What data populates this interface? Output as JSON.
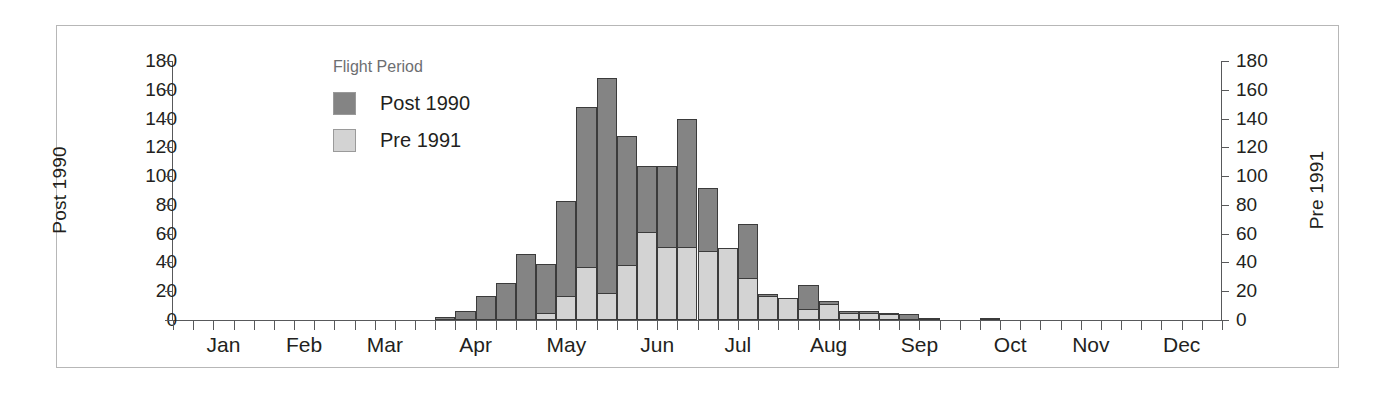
{
  "chart_data": {
    "type": "bar",
    "title": "",
    "subtitle": "",
    "xlabel": "",
    "ylabel": "Post 1990",
    "y2label": "Pre 1991",
    "ylim": [
      0,
      180
    ],
    "y2lim": [
      0,
      180
    ],
    "grid": false,
    "bar_mode": "overlay",
    "legend": {
      "position": "inside-top-left",
      "title": "Flight Period",
      "entries": [
        {
          "name": "Post 1990",
          "color": "#848484"
        },
        {
          "name": "Pre 1991",
          "color": "#d3d3d3"
        }
      ]
    },
    "x_axis": {
      "type": "week-of-year",
      "tick_count": 52,
      "month_labels": [
        "Jan",
        "Feb",
        "Mar",
        "Apr",
        "May",
        "Jun",
        "Jul",
        "Aug",
        "Sep",
        "Oct",
        "Nov",
        "Dec"
      ],
      "month_label_weeks": [
        2.5,
        6.5,
        10.5,
        15.0,
        19.5,
        24.0,
        28.0,
        32.5,
        37.0,
        41.5,
        45.5,
        50.0
      ]
    },
    "y_ticks": [
      0,
      20,
      40,
      60,
      80,
      100,
      120,
      140,
      160,
      180
    ],
    "y2_ticks": [
      0,
      20,
      40,
      60,
      80,
      100,
      120,
      140,
      160,
      180
    ],
    "series": [
      {
        "name": "Post 1990",
        "color": "#848484",
        "weeks": [
          14,
          15,
          16,
          17,
          18,
          19,
          20,
          21,
          22,
          23,
          24,
          25,
          26,
          27,
          28,
          29,
          30,
          31,
          32,
          33,
          34,
          35,
          36,
          37,
          38,
          41
        ],
        "values": [
          2,
          6,
          17,
          26,
          46,
          39,
          83,
          148,
          168,
          128,
          107,
          107,
          140,
          92,
          50,
          67,
          18,
          15,
          24,
          13,
          6,
          6,
          5,
          4,
          1,
          1
        ]
      },
      {
        "name": "Pre 1991",
        "color": "#d3d3d3",
        "weeks": [
          19,
          20,
          21,
          22,
          23,
          24,
          25,
          26,
          27,
          28,
          29,
          30,
          31,
          32,
          33,
          34,
          35,
          36
        ],
        "values": [
          5,
          17,
          37,
          19,
          38,
          61,
          51,
          51,
          48,
          50,
          29,
          17,
          15,
          8,
          11,
          5,
          5,
          4
        ]
      }
    ]
  },
  "axes": {
    "left_title": "Post 1990",
    "right_title": "Pre 1991",
    "tick_labels": [
      "180",
      "160",
      "140",
      "120",
      "100",
      "80",
      "60",
      "40",
      "20",
      "0"
    ]
  },
  "legend": {
    "title": "Flight Period",
    "items": [
      {
        "label": "Post 1990"
      },
      {
        "label": "Pre 1991"
      }
    ]
  },
  "months": [
    "Jan",
    "Feb",
    "Mar",
    "Apr",
    "May",
    "Jun",
    "Jul",
    "Aug",
    "Sep",
    "Oct",
    "Nov",
    "Dec"
  ]
}
